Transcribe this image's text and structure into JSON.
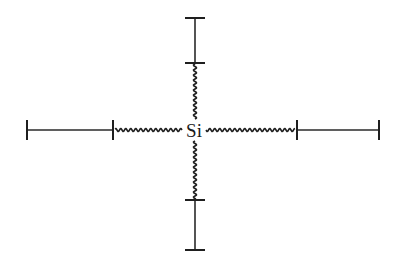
{
  "diagram": {
    "center_atom": {
      "label": "Si",
      "x": 194,
      "y": 130
    },
    "colors": {
      "ink": "#222222",
      "background": "#ffffff"
    },
    "branches": [
      {
        "direction": "up",
        "wavy_from": [
          195,
          119
        ],
        "wavy_to": [
          195,
          64
        ],
        "rigid_from": [
          195,
          63
        ],
        "rigid_to": [
          195,
          18
        ]
      },
      {
        "direction": "down",
        "wavy_from": [
          195,
          141
        ],
        "wavy_to": [
          195,
          199
        ],
        "rigid_from": [
          195,
          200
        ],
        "rigid_to": [
          195,
          250
        ]
      },
      {
        "direction": "left",
        "wavy_from": [
          182,
          130
        ],
        "wavy_to": [
          115,
          130
        ],
        "rigid_from": [
          113,
          130
        ],
        "rigid_to": [
          27,
          130
        ]
      },
      {
        "direction": "right",
        "wavy_from": [
          206,
          130
        ],
        "wavy_to": [
          295,
          130
        ],
        "rigid_from": [
          297,
          130
        ],
        "rigid_to": [
          379,
          130
        ]
      }
    ]
  }
}
